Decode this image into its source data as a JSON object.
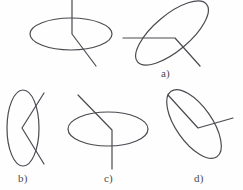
{
  "figure": {
    "background_color": "#fefefe",
    "stroke_color": "#4a4a50",
    "stroke_width": 1.2,
    "width": 243,
    "height": 190,
    "reference": {
      "name": "reference-figure",
      "label": "",
      "ellipse": {
        "cx": 71,
        "cy": 34,
        "rx": 41,
        "ry": 16,
        "rotation": 0
      },
      "polyline": [
        [
          72,
          0
        ],
        [
          72,
          34
        ],
        [
          96,
          66
        ]
      ]
    },
    "options": [
      {
        "key": "a",
        "name": "option-a",
        "label": "a)",
        "label_x": 161,
        "label_y": 68,
        "ellipse": {
          "cx": 172,
          "cy": 33,
          "rx": 45,
          "ry": 18,
          "rotation": -40
        },
        "polyline": [
          [
            123,
            38
          ],
          [
            175,
            38
          ],
          [
            200,
            66
          ]
        ]
      },
      {
        "key": "b",
        "name": "option-b",
        "label": "b)",
        "label_x": 18,
        "label_y": 173,
        "ellipse": {
          "cx": 23,
          "cy": 128,
          "rx": 16,
          "ry": 38,
          "rotation": 0
        },
        "polyline": [
          [
            44,
            93
          ],
          [
            22,
            128
          ],
          [
            44,
            164
          ]
        ]
      },
      {
        "key": "c",
        "name": "option-c",
        "label": "c)",
        "label_x": 104,
        "label_y": 173,
        "ellipse": {
          "cx": 108,
          "cy": 129,
          "rx": 40,
          "ry": 17,
          "rotation": 0
        },
        "polyline": [
          [
            78,
            95
          ],
          [
            112,
            130
          ],
          [
            112,
            169
          ]
        ]
      },
      {
        "key": "d",
        "name": "option-d",
        "label": "d)",
        "label_x": 194,
        "label_y": 173,
        "ellipse": {
          "cx": 194,
          "cy": 124,
          "rx": 40,
          "ry": 18,
          "rotation": 55
        },
        "polyline": [
          [
            168,
            95
          ],
          [
            198,
            128
          ],
          [
            233,
            118
          ]
        ]
      }
    ]
  }
}
